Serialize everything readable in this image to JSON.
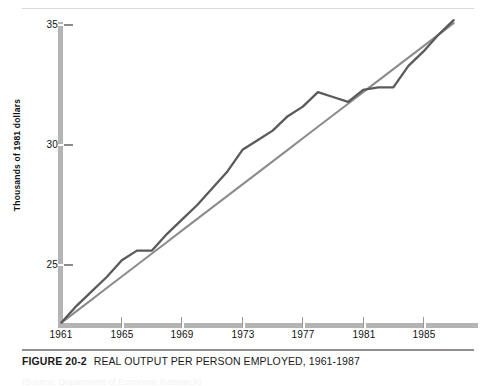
{
  "caption": {
    "figure_number": "FIGURE 20-2",
    "title": "REAL OUTPUT PER PERSON EMPLOYED, 1961-1987"
  },
  "source_note": "(Source: Department of Economic Research)",
  "colors": {
    "axis": "#b4b4b4",
    "data_line": "#5a5a5a",
    "trend_line": "#8c8c8c",
    "text": "#111111",
    "caption_rule": "#8f8f8f"
  },
  "chart_data": {
    "type": "line",
    "title": "REAL OUTPUT PER PERSON EMPLOYED, 1961-1987",
    "xlabel": "",
    "ylabel": "Thousands of 1981 dollars",
    "xlim": [
      1961,
      1987
    ],
    "ylim": [
      22.5,
      35.6
    ],
    "yticks": [
      25,
      30,
      35
    ],
    "ytick_labels": [
      "25",
      "30",
      "35"
    ],
    "xticks": [
      1961,
      1965,
      1969,
      1973,
      1977,
      1981,
      1985
    ],
    "xtick_labels": [
      "1961",
      "1965",
      "1969",
      "1973",
      "1977",
      "1981",
      "1985"
    ],
    "grid": false,
    "legend": "none",
    "x": [
      1961,
      1962,
      1963,
      1964,
      1965,
      1966,
      1967,
      1968,
      1969,
      1970,
      1971,
      1972,
      1973,
      1974,
      1975,
      1976,
      1977,
      1978,
      1979,
      1980,
      1981,
      1982,
      1983,
      1984,
      1985,
      1986,
      1987
    ],
    "series": [
      {
        "name": "Real output per person employed",
        "kind": "data",
        "values": [
          22.6,
          23.3,
          23.9,
          24.5,
          25.2,
          25.6,
          25.6,
          26.3,
          26.9,
          27.5,
          28.2,
          28.9,
          29.8,
          30.2,
          30.6,
          31.2,
          31.6,
          32.2,
          32.0,
          31.8,
          32.3,
          32.4,
          32.4,
          33.3,
          33.9,
          34.6,
          35.2
        ]
      },
      {
        "name": "Trend",
        "kind": "trend",
        "values": [
          22.6,
          23.08,
          23.56,
          24.04,
          24.52,
          25.0,
          25.48,
          25.96,
          26.44,
          26.92,
          27.4,
          27.88,
          28.36,
          28.84,
          29.32,
          29.8,
          30.28,
          30.76,
          31.24,
          31.72,
          32.2,
          32.68,
          33.16,
          33.64,
          34.12,
          34.6,
          35.08
        ]
      }
    ]
  }
}
